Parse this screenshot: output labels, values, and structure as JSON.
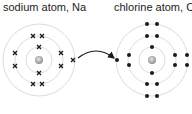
{
  "atoms": [
    {
      "label": "sodium atom, Na",
      "symbol": "Na",
      "electron_marker": "cross",
      "shells": [
        2,
        8,
        1
      ]
    },
    {
      "label": "chlorine atom, Cl",
      "symbol": "Cl",
      "electron_marker": "dot",
      "shells": [
        2,
        8,
        7
      ]
    }
  ],
  "arrow": {
    "from": "sodium outer electron",
    "to": "chlorine outer shell"
  },
  "colors": {
    "ring": "#d9d9d9",
    "electron": "#1a1a1a",
    "nucleus": "#9a9a9a",
    "text": "#222222"
  }
}
